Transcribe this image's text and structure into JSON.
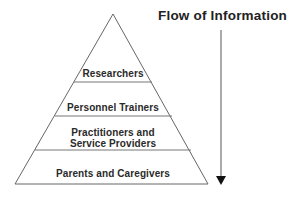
{
  "diagram": {
    "type": "pyramid",
    "tiers": [
      {
        "label": "Researchers"
      },
      {
        "label": "Personnel Trainers"
      },
      {
        "label": "Practitioners and",
        "label2": "Service Providers"
      },
      {
        "label": "Parents and Caregivers"
      }
    ],
    "arrow": {
      "label": "Flow of Information",
      "direction": "down"
    }
  },
  "colors": {
    "line": "#555555",
    "text": "#2a2a2a",
    "arrowhead": "#111111"
  }
}
